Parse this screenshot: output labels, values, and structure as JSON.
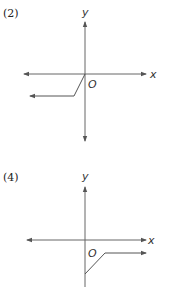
{
  "figures": [
    {
      "label": "(2)",
      "x_axis_label": "x",
      "y_axis_label": "y",
      "origin_label": "O",
      "description": "Graph starts at origin, slopes down-left, then continues as a horizontal ray to the left below the x-axis"
    },
    {
      "label": "(4)",
      "x_axis_label": "x",
      "y_axis_label": "y",
      "origin_label": "O",
      "description": "Graph starts on negative y-axis, slopes up-right, then continues as a horizontal ray to the right below the x-axis"
    }
  ],
  "colors": {
    "axis": "#666666",
    "curve": "#555555",
    "text": "#222222"
  }
}
